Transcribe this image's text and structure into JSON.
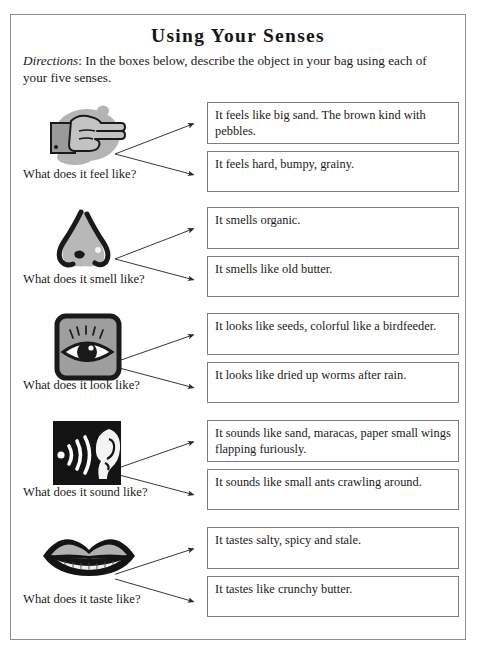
{
  "page": {
    "title": "Using Your Senses",
    "directions_label": "Directions",
    "directions_text": ": In the boxes below, describe the object in your bag using each of your five senses."
  },
  "colors": {
    "page_border": "#8f8f8f",
    "box_border": "#7d7d7d",
    "text": "#1a1a1a",
    "icon_gray": "#a8a8a8",
    "icon_mid_gray": "#8c8c8c",
    "icon_black": "#1a1a1a",
    "paper": "#ffffff"
  },
  "senses": [
    {
      "id": "touch",
      "icon": "pointing-hand-icon",
      "label": "What does it feel like?",
      "answers": [
        "It feels like big sand. The brown kind with pebbles.",
        "It feels hard, bumpy, grainy."
      ]
    },
    {
      "id": "smell",
      "icon": "nose-icon",
      "label": "What does it smell like?",
      "answers": [
        "It smells organic.",
        "It smells like old butter."
      ]
    },
    {
      "id": "sight",
      "icon": "eye-icon",
      "label": "What does it look like?",
      "answers": [
        "It looks like seeds, colorful like a birdfeeder.",
        "It looks like dried up worms after rain."
      ]
    },
    {
      "id": "hearing",
      "icon": "ear-icon",
      "label": "What does it sound like?",
      "answers": [
        "It sounds like sand, maracas, paper small wings flapping furiously.",
        "It sounds like small ants crawling around."
      ]
    },
    {
      "id": "taste",
      "icon": "lips-icon",
      "label": "What does it taste like?",
      "answers": [
        "It tastes salty, spicy and stale.",
        "It tastes like crunchy butter."
      ]
    }
  ]
}
